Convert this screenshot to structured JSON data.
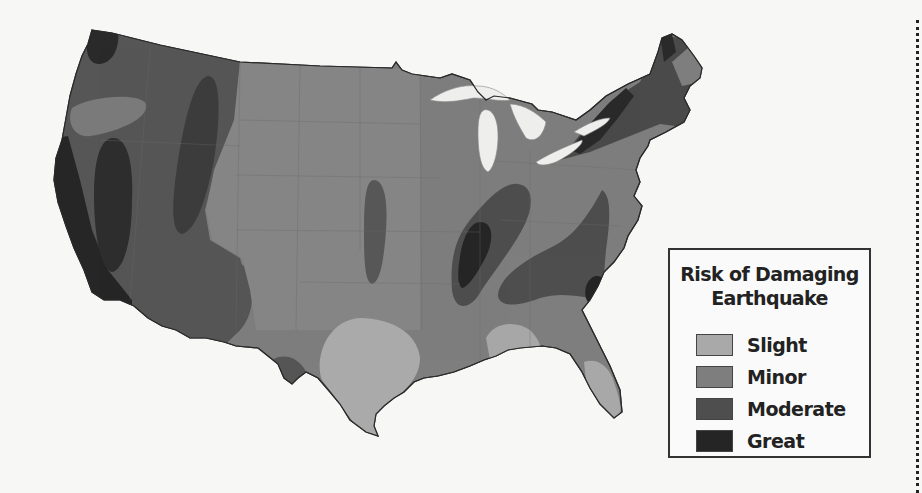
{
  "map": {
    "title": "Risk of Damaging Earthquake",
    "region": "Contiguous United States",
    "background_color": "#f7f7f6",
    "water_color": "#f2f2f0"
  },
  "legend": {
    "title_line1": "Risk of Damaging",
    "title_line2": "Earthquake",
    "items": [
      {
        "label": "Slight",
        "color": "#a9a9a9"
      },
      {
        "label": "Minor",
        "color": "#7e7e7e"
      },
      {
        "label": "Moderate",
        "color": "#4e4e4e"
      },
      {
        "label": "Great",
        "color": "#252525"
      }
    ]
  },
  "zones": [
    {
      "name": "Pacific Northwest minor band",
      "level": "Minor"
    },
    {
      "name": "California great zone",
      "level": "Great"
    },
    {
      "name": "Western moderate zone",
      "level": "Moderate"
    },
    {
      "name": "Intermountain great zone",
      "level": "Great"
    },
    {
      "name": "Central Plains minor zone",
      "level": "Minor"
    },
    {
      "name": "Oklahoma moderate band",
      "level": "Moderate"
    },
    {
      "name": "New Madrid moderate zone",
      "level": "Moderate"
    },
    {
      "name": "New Madrid great core",
      "level": "Great"
    },
    {
      "name": "Southeast moderate zone",
      "level": "Moderate"
    },
    {
      "name": "Charleston great zone",
      "level": "Great"
    },
    {
      "name": "Northeast moderate zone",
      "level": "Moderate"
    },
    {
      "name": "Texas slight zone",
      "level": "Slight"
    },
    {
      "name": "Florida slight zone",
      "level": "Slight"
    },
    {
      "name": "Alabama slight zone",
      "level": "Slight"
    },
    {
      "name": "West Texas moderate spot",
      "level": "Moderate"
    }
  ]
}
